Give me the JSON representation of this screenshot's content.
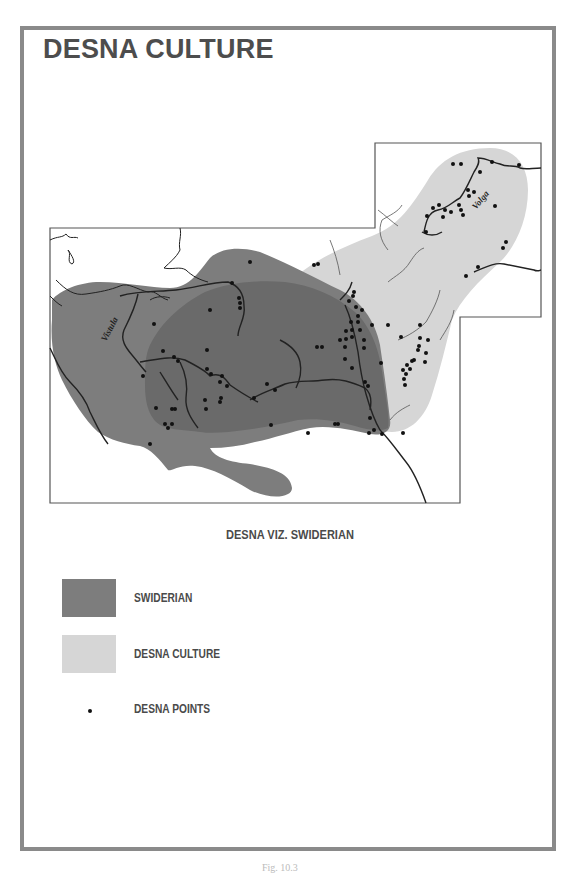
{
  "title": "DESNA CULTURE",
  "map": {
    "subtitle": "DESNA VIZ. SWIDERIAN",
    "river_labels": {
      "vistula": "Vistula",
      "volga": "Volga"
    },
    "colors": {
      "swiderian": "#7d7d7d",
      "swiderian_overlap": "#6a6a6a",
      "desna_culture": "#d6d6d6",
      "desna_points": "#111111",
      "rivers": "#222222",
      "frame": "#8a8a8a"
    }
  },
  "legend": {
    "items": [
      {
        "label": "SWIDERIAN",
        "color": "#7d7d7d",
        "type": "area"
      },
      {
        "label": "DESNA CULTURE",
        "color": "#d6d6d6",
        "type": "area"
      },
      {
        "label": "DESNA POINTS",
        "color": "#111111",
        "type": "point"
      }
    ]
  },
  "caption": "Fig. 10.3"
}
